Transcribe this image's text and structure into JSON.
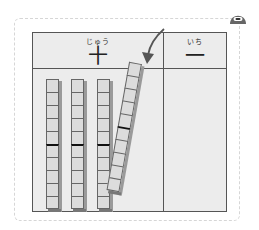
{
  "board": {
    "columns": [
      {
        "ruby": "じゅう",
        "kanji": "十",
        "meaning": "tens"
      },
      {
        "ruby": "いち",
        "kanji": "一",
        "meaning": "ones"
      }
    ],
    "tens_rods_in_place": 3,
    "moving_rods": 1,
    "units_per_rod": 10
  },
  "colors": {
    "board_bg": "#ececec",
    "grid_line": "#555555",
    "rod_cell": "#dcdcdc",
    "outer_dashed": "#d6d6d6",
    "mascot": "#666666"
  },
  "icons": {
    "mascot": "mascot-icon",
    "arrow": "curved-arrow-icon"
  }
}
